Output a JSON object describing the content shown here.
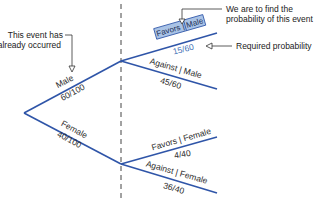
{
  "diagram": {
    "type": "probability-tree",
    "colors": {
      "branch": "#2f55a8",
      "highlight_box": "#a9c3e6",
      "highlight_text": "#3f6fb5",
      "divider": "#444444",
      "annotation": "#222222"
    },
    "branches": {
      "male": {
        "label": "Male",
        "fraction": "60/100"
      },
      "female": {
        "label": "Female",
        "fraction": "40/100"
      },
      "favors_male": {
        "label": "Favors | Male",
        "fraction": "15/60"
      },
      "against_male": {
        "label": "Against | Male",
        "fraction": "45/60"
      },
      "favors_female": {
        "label": "Favors | Female",
        "fraction": "4/40"
      },
      "against_female": {
        "label": "Against | Female",
        "fraction": "36/40"
      }
    },
    "annotations": {
      "occurred_line1": "This event has",
      "occurred_line2": "already occurred",
      "find_line1": "We are to find the",
      "find_line2": "probability of this event",
      "required": "Required probability"
    }
  }
}
